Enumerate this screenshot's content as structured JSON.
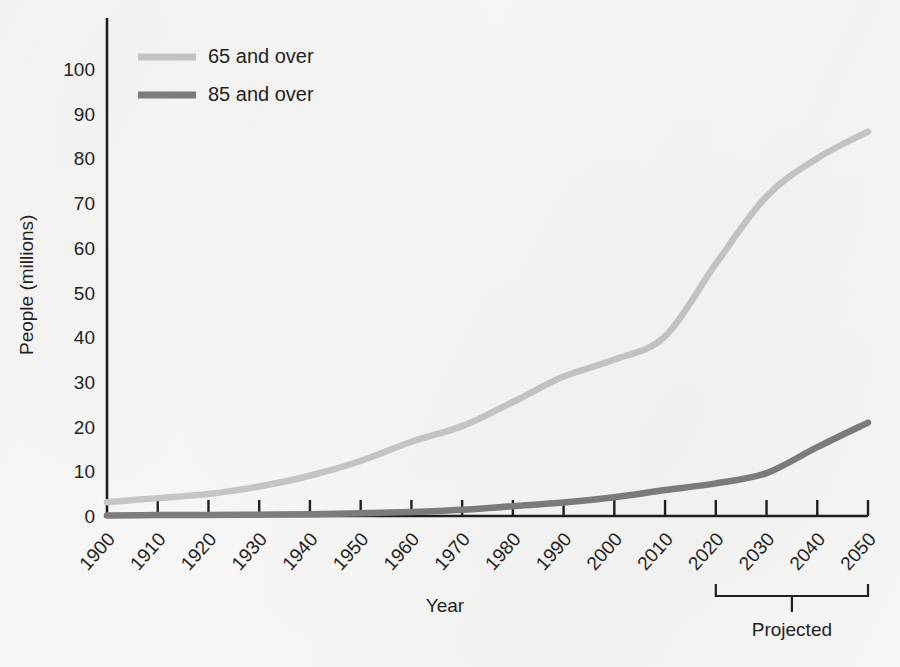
{
  "chart_data": {
    "type": "line",
    "title": "",
    "xlabel": "Year",
    "ylabel": "People (millions)",
    "xlim": [
      1900,
      2050
    ],
    "ylim": [
      0,
      105
    ],
    "yticks": [
      0,
      10,
      20,
      30,
      40,
      50,
      60,
      70,
      80,
      90,
      100
    ],
    "ytick_labels": [
      "0",
      "10",
      "20",
      "30",
      "40",
      "50",
      "60",
      "70",
      "80",
      "90",
      "100"
    ],
    "categories": [
      1900,
      1910,
      1920,
      1930,
      1940,
      1950,
      1960,
      1970,
      1980,
      1990,
      2000,
      2010,
      2020,
      2030,
      2040,
      2050
    ],
    "xtick_labels": [
      "1900",
      "1910",
      "1920",
      "1930",
      "1940",
      "1950",
      "1960",
      "1970",
      "1980",
      "1990",
      "2000",
      "2010",
      "2020",
      "2030",
      "2040",
      "2050"
    ],
    "grid": false,
    "legend_position": "top-left",
    "series": [
      {
        "name": "65 and over",
        "color": "#c6c6c6",
        "values": [
          3.1,
          4.0,
          4.9,
          6.6,
          9.0,
          12.3,
          16.6,
          20.1,
          25.5,
          31.2,
          35.0,
          40.2,
          56.4,
          71.5,
          80.0,
          86.0
        ]
      },
      {
        "name": "85 and over",
        "color": "#7d7d7d",
        "values": [
          0.1,
          0.2,
          0.2,
          0.3,
          0.4,
          0.6,
          0.9,
          1.4,
          2.2,
          3.0,
          4.2,
          5.8,
          7.3,
          9.6,
          15.4,
          20.9
        ]
      }
    ],
    "annotations": [
      {
        "name": "projected-bracket",
        "label": "Projected",
        "from_x": 2020,
        "to_x": 2050
      }
    ]
  },
  "legend": {
    "items": [
      {
        "label": "65 and over",
        "color": "#c6c6c6"
      },
      {
        "label": "85 and over",
        "color": "#7d7d7d"
      }
    ]
  },
  "axes": {
    "x_title": "Year",
    "y_title": "People (millions)"
  },
  "colors": {
    "background": "#f6f6f4",
    "axis": "#1f1f1f",
    "series_65": "#c6c6c6",
    "series_85": "#7d7d7d"
  }
}
